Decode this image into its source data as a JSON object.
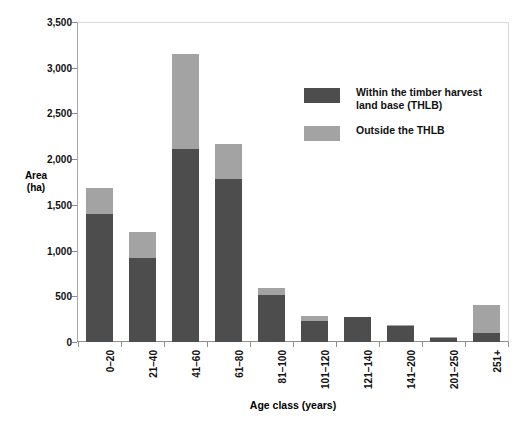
{
  "chart_data": {
    "type": "bar",
    "subtype": "stacked-vertical",
    "title": "",
    "xlabel": "Age class (years)",
    "ylabel": "Area\n(ha)",
    "ylabel_line1": "Area",
    "ylabel_line2": "(ha)",
    "ylim": [
      0,
      3500
    ],
    "ytick_step": 500,
    "yticks": [
      "0",
      "500",
      "1,000",
      "1,500",
      "2,000",
      "2,500",
      "3,000",
      "3,500"
    ],
    "ytick_values": [
      0,
      500,
      1000,
      1500,
      2000,
      2500,
      3000,
      3500
    ],
    "grid": false,
    "legend_position": "inside-upper-right",
    "categories": [
      "0–20",
      "21–40",
      "41–60",
      "61–80",
      "81–100",
      "101–120",
      "121–140",
      "141–200",
      "201–250",
      "251+"
    ],
    "series": [
      {
        "name": "Within the timber harvest land base (THLB)",
        "color": "#4d4d4d",
        "values": [
          1400,
          920,
          2110,
          1780,
          510,
          230,
          270,
          170,
          50,
          100
        ]
      },
      {
        "name": "Outside the THLB",
        "color": "#a3a3a3",
        "values": [
          290,
          280,
          1040,
          390,
          80,
          50,
          0,
          20,
          10,
          300
        ]
      }
    ],
    "totals": [
      1690,
      1200,
      3150,
      2170,
      590,
      280,
      270,
      190,
      60,
      400
    ]
  },
  "legend": {
    "items": [
      {
        "label_line1": "Within the timber harvest",
        "label_line2": "land base (THLB)",
        "swatch": "#4d4d4d"
      },
      {
        "label_line1": "Outside the THLB",
        "label_line2": "",
        "swatch": "#a3a3a3"
      }
    ]
  },
  "caption": {
    "text": ""
  }
}
